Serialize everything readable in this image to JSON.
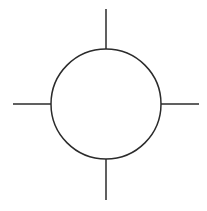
{
  "figure": {
    "canvas": {
      "width": 207,
      "height": 211,
      "background_color": "#ffffff"
    },
    "style": {
      "stroke_color": "#2b2b2b",
      "stroke_width": 1.5,
      "fill": "none"
    },
    "shapes": {
      "circle": {
        "name": "circle-outline",
        "center_x": 106,
        "center_y": 104,
        "radius": 55
      },
      "spokes": [
        {
          "name": "spoke-top",
          "direction": "north",
          "x1": 106,
          "y1": 9,
          "x2": 106,
          "y2": 49,
          "length": 40
        },
        {
          "name": "spoke-right",
          "direction": "east",
          "x1": 161,
          "y1": 104,
          "x2": 199,
          "y2": 104,
          "length": 38
        },
        {
          "name": "spoke-bottom",
          "direction": "south",
          "x1": 106,
          "y1": 159,
          "x2": 106,
          "y2": 200,
          "length": 41
        },
        {
          "name": "spoke-left",
          "direction": "west",
          "x1": 13,
          "y1": 104,
          "x2": 51,
          "y2": 104,
          "length": 38
        }
      ]
    }
  }
}
